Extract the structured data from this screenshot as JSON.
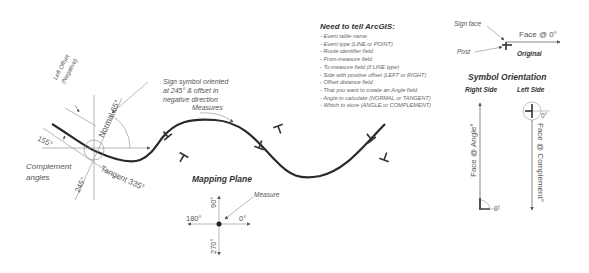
{
  "diagram": {
    "left_labels": {
      "left_offset": "Left Offset",
      "negative": "(Negative)",
      "normal": "Normal 65°",
      "angle_155": "155°",
      "angle_245": "245°",
      "tangent": "Tangent 335°",
      "complement_1": "Complement",
      "complement_2": "angles",
      "sign_note_1": "Sign symbol oriented",
      "sign_note_2": "at 245° & offset in",
      "sign_note_3": "negative direction",
      "measures": "Measures"
    },
    "instructions": {
      "heading": "Need to tell ArcGIS:",
      "items": [
        "- Event table name",
        "- Event type (LINE or POINT)",
        "- Route identifier field",
        "- From-measure field",
        "- To-measure field (if LINE type)",
        "- Side with positive offset (LEFT or RIGHT)",
        "- Offset distance field",
        "- That you want to create an Angle field",
        "- Angle to calculate (NORMAL or TANGENT)",
        "- Which to store (ANGLE or COMPLEMENT)"
      ]
    },
    "mapping_plane": {
      "title": "Mapping Plane",
      "measure": "Measure",
      "deg_90": "90°",
      "deg_180": "180°",
      "deg_0": "0°",
      "deg_270": "270°"
    },
    "original": {
      "sign_face": "Sign face",
      "post": "Post",
      "face_0": "Face @ 0°",
      "title": "Original"
    },
    "orientation": {
      "title": "Symbol Orientation",
      "right_side": "Right Side",
      "left_side": "Left Side",
      "face_angle": "Face @ Angle°",
      "face_complement": "Face @ Complement°",
      "zero_right": "0°",
      "zero_left": "0°"
    },
    "colors": {
      "curve": "#2a2a2a",
      "thin_line": "#9a9a9a",
      "text": "#555555"
    }
  }
}
